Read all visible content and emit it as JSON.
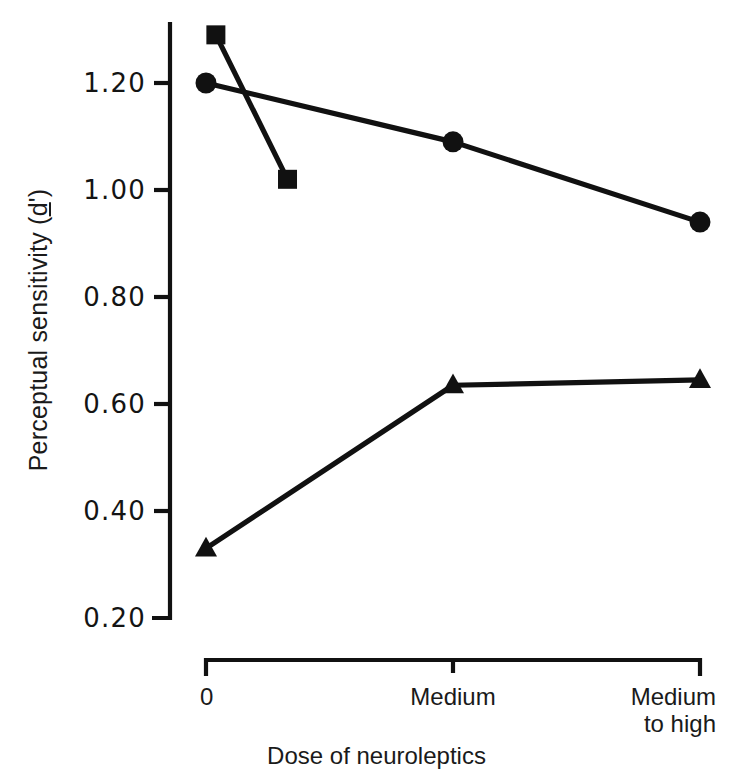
{
  "chart_data": {
    "type": "line",
    "title": "",
    "subtitle": "",
    "xlabel": "Dose of neuroleptics",
    "ylabel": "Perceptual sensitivity (d')",
    "ylabel_parts": {
      "main": "Perceptual sensitivity (",
      "dprime": "d",
      "tail": "')"
    },
    "categories": [
      "0",
      "Medium",
      "Medium to high"
    ],
    "category_labels": [
      "0",
      "Medium",
      "Medium\nto high"
    ],
    "x": [
      0,
      1,
      2
    ],
    "ylim": [
      0.2,
      1.3
    ],
    "yticks": [
      1.2,
      1.0,
      0.8,
      0.6,
      0.4,
      0.2
    ],
    "ytick_labels": [
      "1.20",
      "1.00",
      "0.80",
      "0.60",
      "0.40",
      "0.20"
    ],
    "grid": false,
    "legend": "none",
    "axis_color": "#111111",
    "series": [
      {
        "name": "circle-series",
        "marker": "circle",
        "color": "#111111",
        "x": [
          0,
          1,
          2
        ],
        "values": [
          1.2,
          1.09,
          0.94
        ]
      },
      {
        "name": "square-series",
        "marker": "square",
        "color": "#111111",
        "x": [
          0.04,
          0.33
        ],
        "values": [
          1.29,
          1.02
        ]
      },
      {
        "name": "triangle-series",
        "marker": "triangle",
        "color": "#111111",
        "x": [
          0,
          1,
          2
        ],
        "values": [
          0.33,
          0.635,
          0.645
        ]
      }
    ]
  }
}
